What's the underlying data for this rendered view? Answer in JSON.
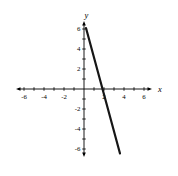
{
  "page": {
    "background_color": "#ffffff"
  },
  "chart_data": {
    "type": "line",
    "title": "",
    "xlabel": "x",
    "ylabel": "y",
    "xlim": [
      -6.6,
      6.6
    ],
    "ylim": [
      -6.6,
      6.6
    ],
    "grid": false,
    "axes_cross_at_origin": true,
    "axis_color": "#000000",
    "minor_tick_step": 1,
    "x_tick_values": [
      -6,
      -4,
      -2,
      2,
      4,
      6
    ],
    "x_tick_labels": [
      "-6",
      "-4",
      "-2",
      "2",
      "4",
      "6"
    ],
    "y_tick_values": [
      6,
      4,
      2,
      -2,
      -4,
      -6
    ],
    "y_tick_labels": [
      "6",
      "4",
      "2",
      "-2",
      "-4",
      "-6"
    ],
    "series": [
      {
        "name": "plotted-line",
        "type": "segment",
        "color": "#161616",
        "stroke_width": 2.2,
        "points": [
          [
            0.2,
            6.1
          ],
          [
            3.6,
            -6.45
          ]
        ],
        "slope_estimate": -3.7,
        "x_intercept_estimate": 1.9
      }
    ]
  }
}
